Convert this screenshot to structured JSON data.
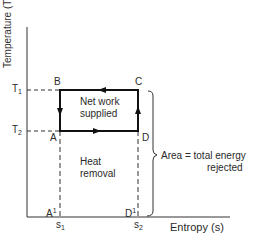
{
  "diagram": {
    "y_axis_label": "Temperature (T)",
    "x_axis_label": "Entropy (s)",
    "y_ticks": [
      {
        "label": "T",
        "subscript": "1",
        "y": 90
      },
      {
        "label": "T",
        "subscript": "2",
        "y": 131
      }
    ],
    "x_ticks": [
      {
        "label": "s",
        "subscript": "1",
        "x": 60
      },
      {
        "label": "s",
        "subscript": "2",
        "x": 138
      }
    ],
    "points": {
      "A": "A",
      "B": "B",
      "C": "C",
      "D": "D",
      "A_prime": "A",
      "A_prime_sup": "1",
      "D_prime": "D",
      "D_prime_sup": "1"
    },
    "cycle_label_line1": "Net work",
    "cycle_label_line2": "supplied",
    "area_label_line1": "Heat",
    "area_label_line2": "removal",
    "bracket_label_line1": "Area =  total energy",
    "bracket_label_line2": "rejected",
    "colors": {
      "line": "#1a1a1a",
      "text": "#2a2a2a"
    }
  }
}
